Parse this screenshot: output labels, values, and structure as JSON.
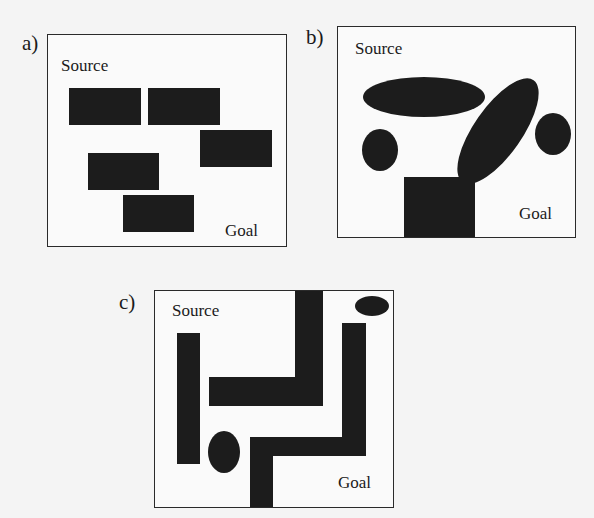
{
  "figure": {
    "panels": [
      {
        "id": "a",
        "label": "a)",
        "source_label": "Source",
        "goal_label": "Goal",
        "obstacle_type": "rectangles",
        "obstacle_count": 5
      },
      {
        "id": "b",
        "label": "b)",
        "source_label": "Source",
        "goal_label": "Goal",
        "obstacle_type": "ellipses-and-square",
        "obstacle_count": 5
      },
      {
        "id": "c",
        "label": "c)",
        "source_label": "Source",
        "goal_label": "Goal",
        "obstacle_type": "maze-walls",
        "obstacle_count": 6
      }
    ],
    "colors": {
      "obstacle": "#1c1c1c",
      "border": "#2a2a2a",
      "background": "#fafafa"
    }
  }
}
